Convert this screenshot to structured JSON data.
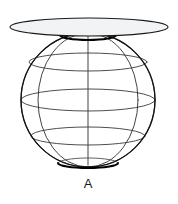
{
  "figure": {
    "type": "geometric-line-drawing",
    "background_color": "#ffffff",
    "canvas": {
      "width": 178,
      "height": 204
    },
    "labels": [
      {
        "id": "point-a",
        "text": "A",
        "x": 88,
        "y": 188,
        "color": "#1a1a1a",
        "font_size": 13
      }
    ],
    "sphere": {
      "name": "wireframe-globe",
      "center_x": 88,
      "center_y": 100,
      "radius": 67,
      "outline_color": "#111111",
      "outline_width": 1.3,
      "grid_color": "#3a3a3a",
      "grid_width": 0.9,
      "latitude_lines": [
        {
          "id": "lat-top-cap",
          "y": 35,
          "half_width": 28,
          "ellipse_ry": 5
        },
        {
          "id": "lat-upper",
          "y": 62,
          "half_width": 59,
          "ellipse_ry": 9
        },
        {
          "id": "lat-equator",
          "y": 100,
          "half_width": 67,
          "ellipse_ry": 11
        },
        {
          "id": "lat-lower",
          "y": 136,
          "half_width": 57,
          "ellipse_ry": 9
        },
        {
          "id": "lat-bottom-cap",
          "y": 163,
          "half_width": 30,
          "ellipse_ry": 5
        }
      ],
      "meridians": [
        {
          "id": "meridian-1",
          "half_width": 67
        },
        {
          "id": "meridian-2",
          "half_width": 50
        },
        {
          "id": "meridian-3",
          "half_width": 26
        },
        {
          "id": "meridian-4",
          "half_width": 0
        }
      ]
    },
    "plane": {
      "name": "intersecting-disk",
      "center_x": 89,
      "center_y": 27,
      "radius_x": 79,
      "radius_y": 9,
      "fill_color": "#f2f3f5",
      "stroke_color": "#1a1a1a",
      "stroke_width": 1.1
    }
  }
}
